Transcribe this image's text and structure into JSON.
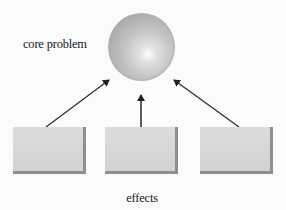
{
  "diagram": {
    "core": {
      "label": "core problem",
      "shape": "sphere"
    },
    "effects": {
      "label": "effects",
      "boxes": [
        {
          "id": "effect-1",
          "label": ""
        },
        {
          "id": "effect-2",
          "label": ""
        },
        {
          "id": "effect-3",
          "label": ""
        }
      ]
    },
    "arrows": [
      {
        "from": "effect-1",
        "to": "core"
      },
      {
        "from": "effect-2",
        "to": "core"
      },
      {
        "from": "effect-3",
        "to": "core"
      }
    ],
    "colors": {
      "background": "#fbfbfb",
      "box_fill": "#d6d6d6",
      "box_shadow": "#8e8e8e",
      "sphere": "#b8b8b8",
      "arrow": "#222222",
      "text": "#1a1a1a"
    }
  }
}
